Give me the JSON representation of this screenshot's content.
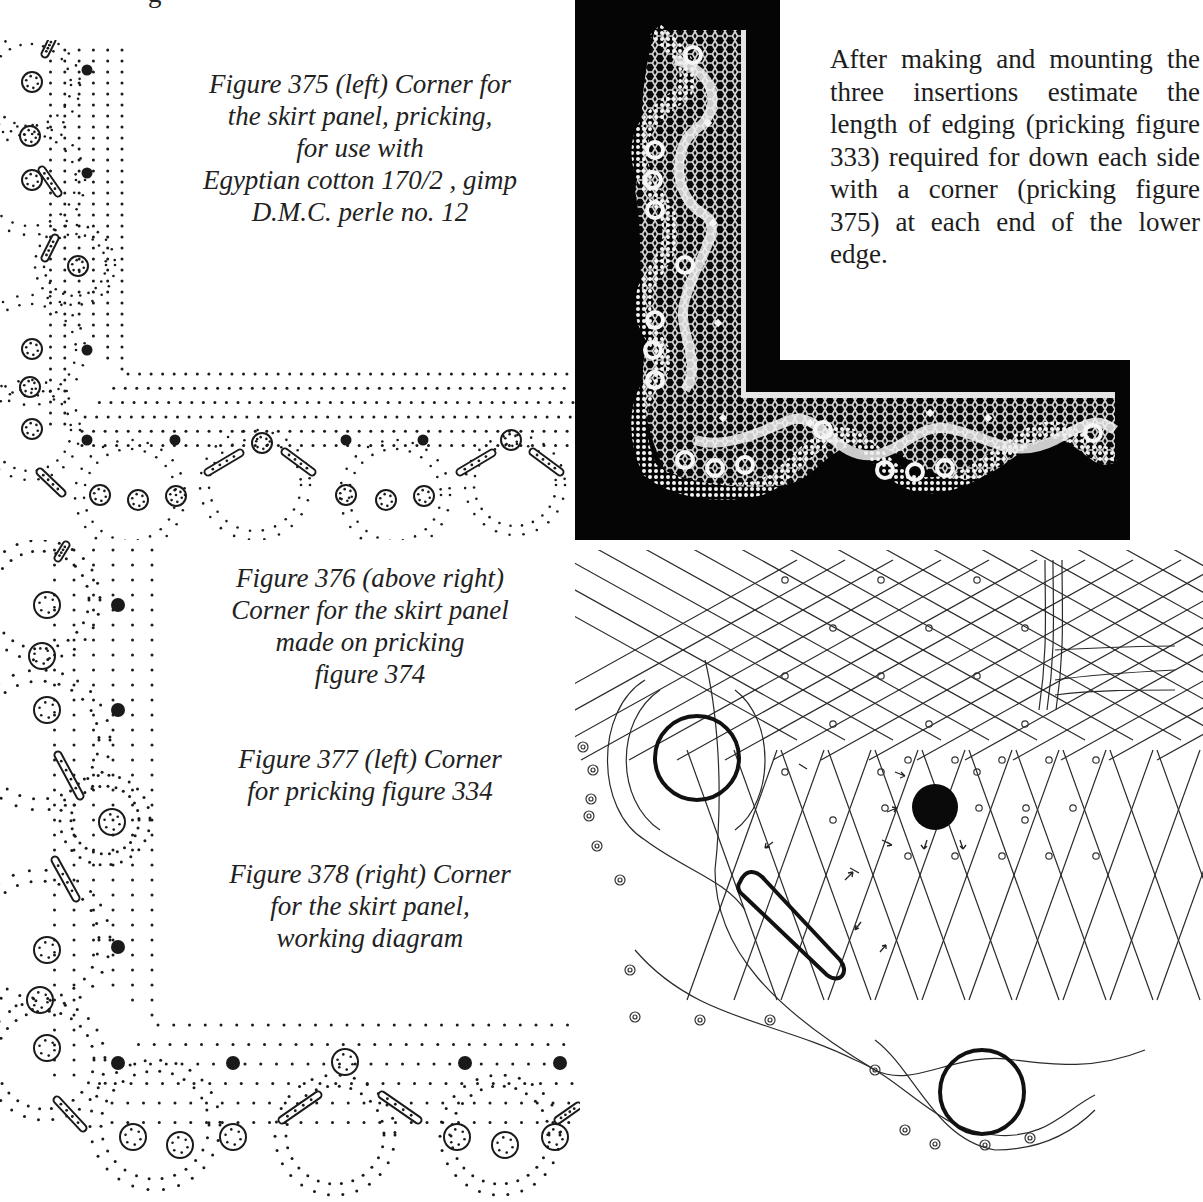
{
  "page": {
    "top_fragment": "g",
    "body_paragraph": "After making and mounting the three insertions estimate the length of edging (pricking figure 333) required for down each side with a corner (pricking figure 375) at each end of the lower edge.",
    "captions": {
      "fig375": [
        "Figure 375 (left) Corner for",
        "the skirt panel, pricking,",
        "for use with",
        "Egyptian cotton 170/2 , gimp",
        "D.M.C. perle no. 12"
      ],
      "fig376": [
        "Figure 376 (above right)",
        "Corner for the skirt panel",
        "made on pricking",
        "figure 374"
      ],
      "fig377": [
        "Figure 377 (left) Corner",
        "for pricking  figure 334"
      ],
      "fig378": [
        "Figure 378 (right) Corner",
        "for the skirt panel,",
        "working diagram"
      ]
    }
  },
  "figures": {
    "fig375": {
      "type": "pricking",
      "scale": 1.0,
      "colors": {
        "ink": "#1a1a1a"
      }
    },
    "fig376": {
      "type": "photograph",
      "subject": "lace corner",
      "colors": {
        "background": "#050505",
        "lace": "#f2f2f2"
      }
    },
    "fig377": {
      "type": "pricking",
      "scale": 1.0,
      "colors": {
        "ink": "#1a1a1a"
      }
    },
    "fig378": {
      "type": "working diagram",
      "colors": {
        "ink": "#222222"
      }
    }
  }
}
